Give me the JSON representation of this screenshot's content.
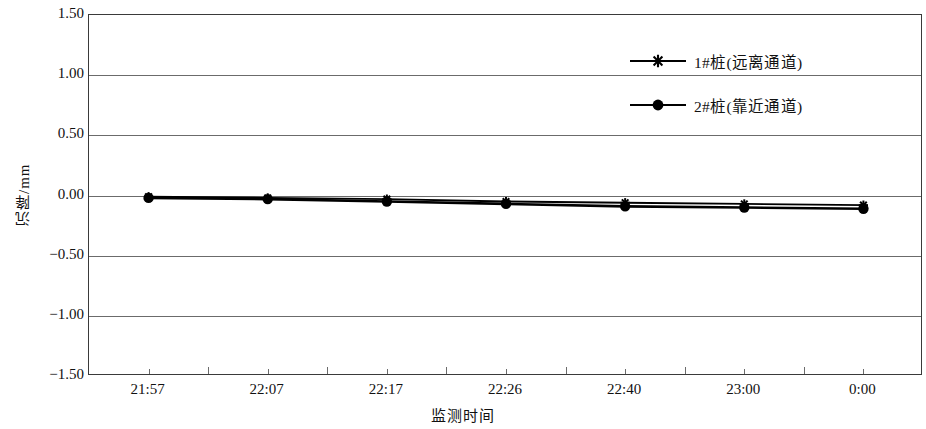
{
  "chart_data": {
    "type": "line",
    "title": "",
    "xlabel": "监测时间",
    "ylabel": "沉降/mm",
    "categories": [
      "21:57",
      "22:07",
      "22:17",
      "22:26",
      "22:40",
      "23:00",
      "0:00"
    ],
    "ylim": [
      -1.5,
      1.5
    ],
    "ytick_labels": [
      "1.50",
      "1.00",
      "0.50",
      "0.00",
      "-0.50",
      "-1.00",
      "-1.50"
    ],
    "ytick_values": [
      1.5,
      1.0,
      0.5,
      0.0,
      -0.5,
      -1.0,
      -1.5
    ],
    "ystep": 0.5,
    "grid": "horizontal",
    "legend_position": "upper-right-inside",
    "series": [
      {
        "name": "1#桩(远离通道)",
        "marker": "star",
        "color": "#000000",
        "values": [
          -0.01,
          -0.02,
          -0.03,
          -0.05,
          -0.06,
          -0.07,
          -0.08
        ]
      },
      {
        "name": "2#桩(靠近通道)",
        "marker": "circle",
        "color": "#000000",
        "values": [
          -0.02,
          -0.03,
          -0.05,
          -0.07,
          -0.09,
          -0.1,
          -0.11
        ]
      }
    ]
  },
  "axes": {
    "frame_color": "#3a3a3a",
    "grid_color": "#6b6b6b"
  }
}
